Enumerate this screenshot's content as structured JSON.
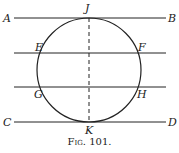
{
  "diagram": {
    "labels": {
      "A": "A",
      "B": "B",
      "C": "C",
      "D": "D",
      "E": "E",
      "F": "F",
      "G": "G",
      "H": "H",
      "J": "J",
      "K": "K"
    },
    "caption": "Fig. 101."
  }
}
